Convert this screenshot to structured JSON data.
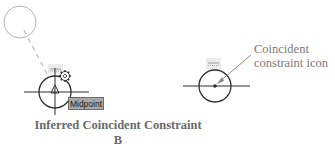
{
  "diagram": {
    "caption": {
      "title": "Inferred Coincident Constraint",
      "label": "B"
    },
    "left_figure": {
      "tooltip": "Midpoint",
      "icons": [
        "inferred-constraint-glyph",
        "gear-icon",
        "midpoint-triangle-icon"
      ]
    },
    "right_figure": {
      "callout_line1": "Coincident",
      "callout_line2": "constraint icon",
      "icons": [
        "coincident-constraint-icon"
      ]
    },
    "colors": {
      "line": "#2e2e2e",
      "faint_circle": "#b5b5b5",
      "dashed_line": "#c8c8c8",
      "callout_text": "#7a7a7a",
      "caption_text": "#6a6a6a",
      "tooltip_bg": "#a8a8a8",
      "icon_bg": "#ececec"
    }
  }
}
